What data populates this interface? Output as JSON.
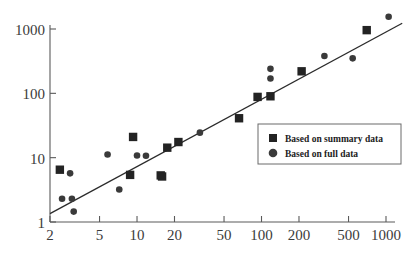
{
  "chart_data": {
    "type": "scatter",
    "title": "",
    "xlabel": "",
    "ylabel": "",
    "xscale": "log",
    "yscale": "log",
    "xlim": [
      2,
      1100
    ],
    "ylim": [
      1,
      1800
    ],
    "grid": false,
    "legend_position": "center-right",
    "xticks": [
      2,
      5,
      10,
      20,
      50,
      100,
      200,
      500,
      1000
    ],
    "xtick_labels": [
      "2",
      "5",
      "10",
      "20",
      "50",
      "100",
      "200",
      "500",
      "1000"
    ],
    "yticks": [
      1,
      10,
      100,
      1000
    ],
    "ytick_labels": [
      "1",
      "10",
      "100",
      "1000"
    ],
    "fit_line": {
      "label": "identity / regression line",
      "x": [
        2.0,
        1350.0
      ],
      "y": [
        1.35,
        1230.0
      ]
    },
    "series": [
      {
        "name": "Based on summary data",
        "marker": "square",
        "color": "#232323",
        "points": [
          {
            "x": 2.4,
            "y": 6.5
          },
          {
            "x": 9.3,
            "y": 21.0
          },
          {
            "x": 8.8,
            "y": 5.4
          },
          {
            "x": 15.5,
            "y": 5.3
          },
          {
            "x": 15.9,
            "y": 5.1
          },
          {
            "x": 17.5,
            "y": 14.3
          },
          {
            "x": 21.5,
            "y": 17.5
          },
          {
            "x": 66.0,
            "y": 41.0
          },
          {
            "x": 93.0,
            "y": 88.0
          },
          {
            "x": 118.0,
            "y": 90.0
          },
          {
            "x": 210.0,
            "y": 220.0
          },
          {
            "x": 700.0,
            "y": 960.0
          }
        ]
      },
      {
        "name": "Based on full data",
        "marker": "circle",
        "color": "#3a3a3a",
        "points": [
          {
            "x": 2.9,
            "y": 5.7
          },
          {
            "x": 2.5,
            "y": 2.3
          },
          {
            "x": 3.0,
            "y": 2.3
          },
          {
            "x": 3.1,
            "y": 1.45
          },
          {
            "x": 5.8,
            "y": 11.2
          },
          {
            "x": 7.2,
            "y": 3.2
          },
          {
            "x": 10.0,
            "y": 10.8
          },
          {
            "x": 11.8,
            "y": 10.7
          },
          {
            "x": 32.0,
            "y": 24.5
          },
          {
            "x": 118.0,
            "y": 240.0
          },
          {
            "x": 118.0,
            "y": 170.0
          },
          {
            "x": 320.0,
            "y": 380.0
          },
          {
            "x": 540.0,
            "y": 350.0
          },
          {
            "x": 1050.0,
            "y": 1550.0
          }
        ]
      }
    ],
    "legend": [
      {
        "marker": "square",
        "label": "Based on summary data"
      },
      {
        "marker": "circle",
        "label": "Based on full data"
      }
    ]
  }
}
